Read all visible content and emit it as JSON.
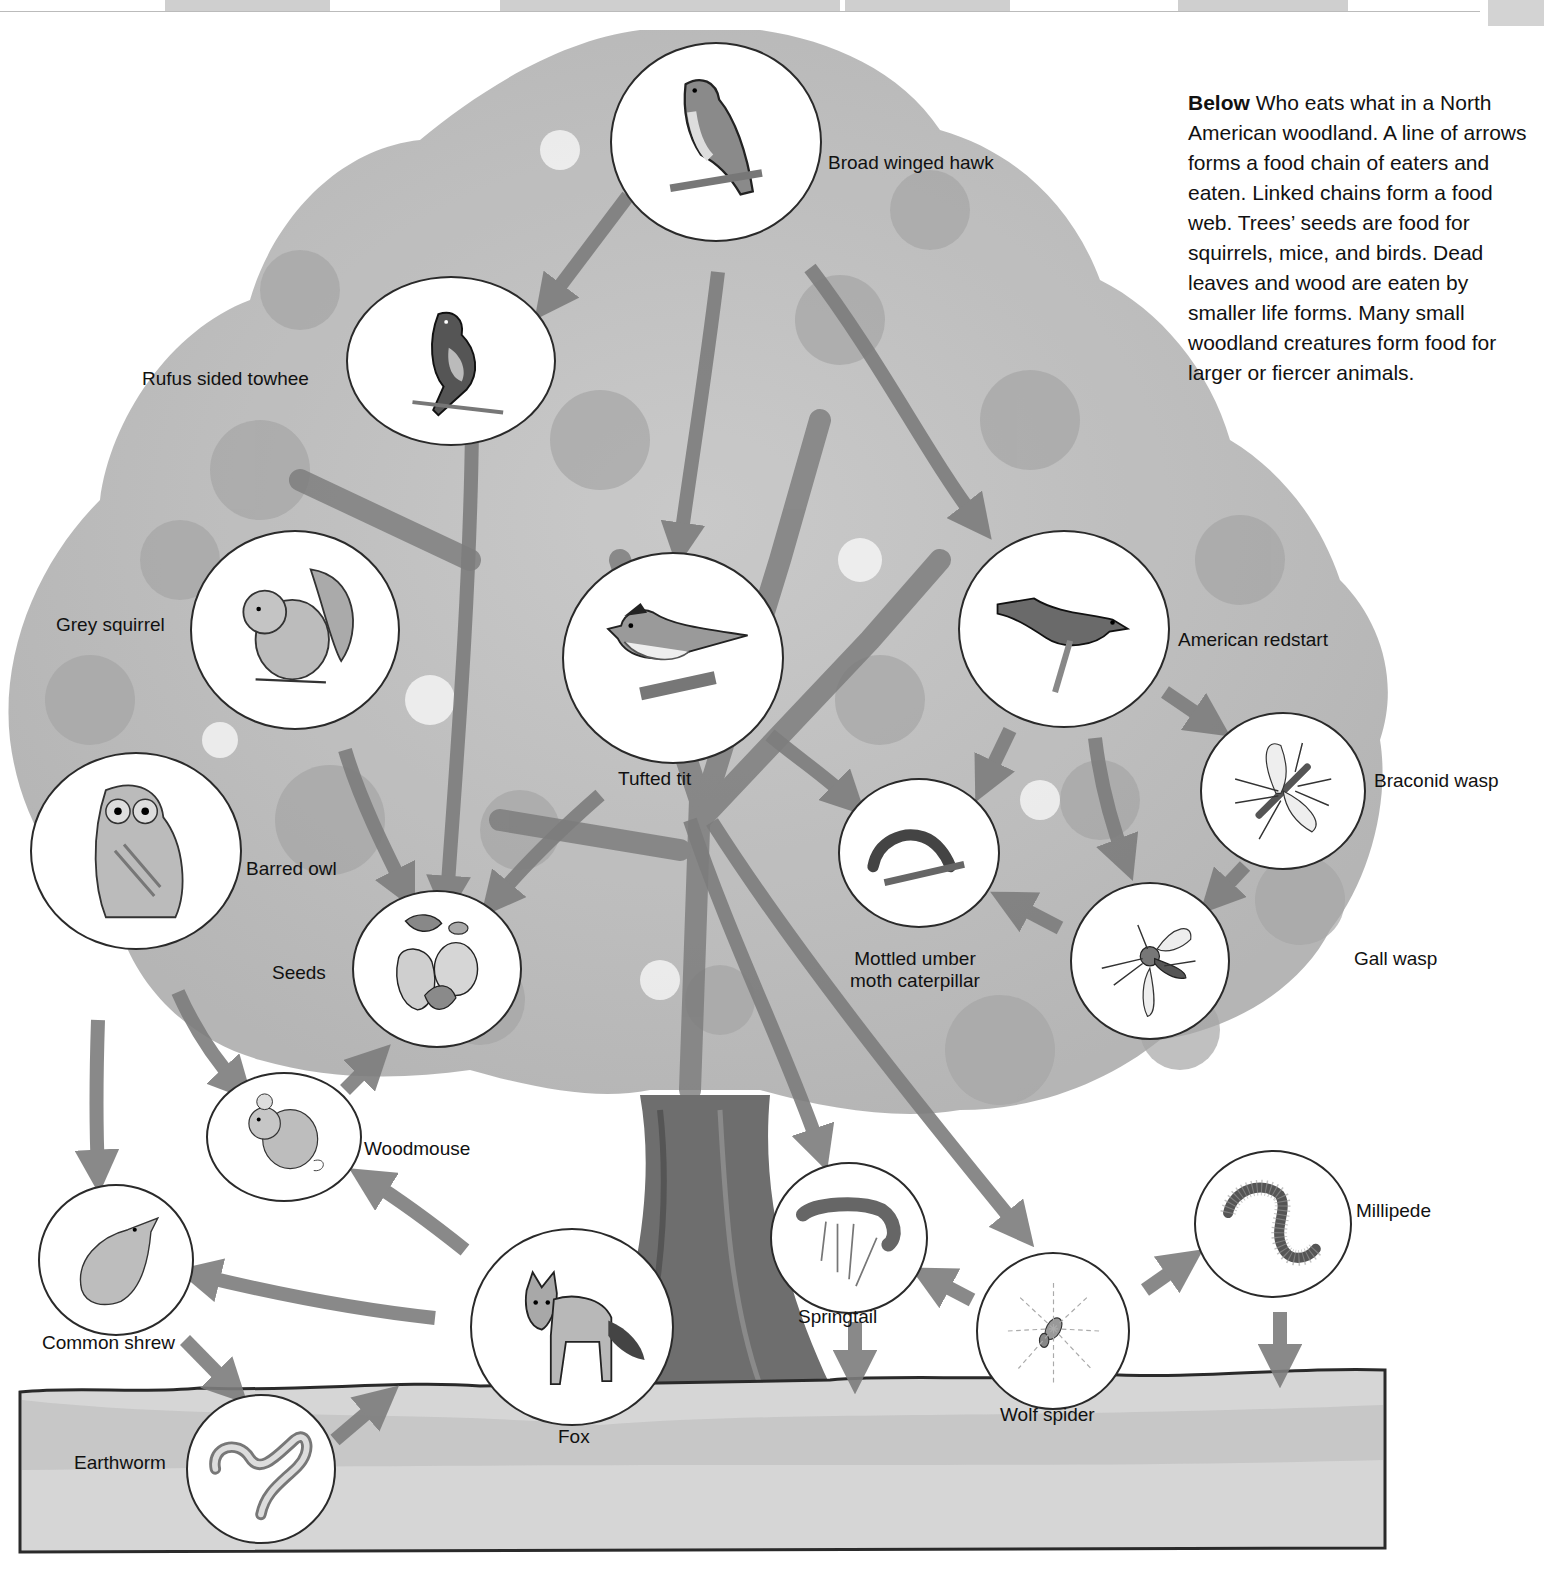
{
  "caption": {
    "lead": "Below",
    "text": "Who eats what in a North American woodland. A line of arrows forms a food chain of eaters and eaten. Linked chains form a food web. Trees’ seeds are food for squirrels, mice, and birds. Dead leaves and wood are eaten by smaller life forms. Many small woodland creatures form food for larger or fiercer animals."
  },
  "colors": {
    "canopy": "#b9b9b9",
    "canopy_dark": "#9a9a9a",
    "trunk": "#6e6e6e",
    "soil": "#d6d6d6",
    "arrow": "#7d7d7d",
    "outline": "#2a2a2a"
  },
  "organisms": [
    {
      "id": "hawk",
      "label": "Broad winged hawk",
      "icon": "hawk-icon"
    },
    {
      "id": "towhee",
      "label": "Rufus sided towhee",
      "icon": "towhee-icon"
    },
    {
      "id": "squirrel",
      "label": "Grey squirrel",
      "icon": "squirrel-icon"
    },
    {
      "id": "tit",
      "label": "Tufted tit",
      "icon": "tufted-tit-icon"
    },
    {
      "id": "redstart",
      "label": "American redstart",
      "icon": "redstart-icon"
    },
    {
      "id": "owl",
      "label": "Barred owl",
      "icon": "owl-icon"
    },
    {
      "id": "seeds",
      "label": "Seeds",
      "icon": "acorn-icon"
    },
    {
      "id": "caterpillar",
      "label": "Mottled umber moth caterpillar",
      "icon": "caterpillar-icon"
    },
    {
      "id": "braconid",
      "label": "Braconid wasp",
      "icon": "braconid-wasp-icon"
    },
    {
      "id": "gallwasp",
      "label": "Gall wasp",
      "icon": "gall-wasp-icon"
    },
    {
      "id": "woodmouse",
      "label": "Woodmouse",
      "icon": "mouse-icon"
    },
    {
      "id": "shrew",
      "label": "Common shrew",
      "icon": "shrew-icon"
    },
    {
      "id": "fox",
      "label": "Fox",
      "icon": "fox-icon"
    },
    {
      "id": "springtail",
      "label": "Springtail",
      "icon": "springtail-icon"
    },
    {
      "id": "wolfspider",
      "label": "Wolf spider",
      "icon": "spider-icon"
    },
    {
      "id": "millipede",
      "label": "Millipede",
      "icon": "millipede-icon"
    },
    {
      "id": "earthworm",
      "label": "Earthworm",
      "icon": "earthworm-icon"
    }
  ],
  "labels": {
    "caterpillar_line1": "Mottled umber",
    "caterpillar_line2": "moth caterpillar"
  },
  "arrows": [
    {
      "from": "hawk",
      "to": "towhee"
    },
    {
      "from": "hawk",
      "to": "tit"
    },
    {
      "from": "hawk",
      "to": "redstart"
    },
    {
      "from": "towhee",
      "to": "seeds"
    },
    {
      "from": "squirrel",
      "to": "seeds"
    },
    {
      "from": "tit",
      "to": "seeds"
    },
    {
      "from": "tit",
      "to": "caterpillar"
    },
    {
      "from": "tit",
      "to": "springtail"
    },
    {
      "from": "tit",
      "to": "wolfspider"
    },
    {
      "from": "redstart",
      "to": "braconid"
    },
    {
      "from": "redstart",
      "to": "caterpillar"
    },
    {
      "from": "redstart",
      "to": "gallwasp"
    },
    {
      "from": "braconid",
      "to": "gallwasp"
    },
    {
      "from": "gallwasp",
      "to": "caterpillar"
    },
    {
      "from": "owl",
      "to": "woodmouse"
    },
    {
      "from": "owl",
      "to": "shrew"
    },
    {
      "from": "woodmouse",
      "to": "seeds"
    },
    {
      "from": "fox",
      "to": "woodmouse"
    },
    {
      "from": "fox",
      "to": "shrew"
    },
    {
      "from": "shrew",
      "to": "earthworm"
    },
    {
      "from": "earthworm",
      "to": "soil"
    },
    {
      "from": "wolfspider",
      "to": "springtail"
    },
    {
      "from": "wolfspider",
      "to": "millipede"
    },
    {
      "from": "springtail",
      "to": "soil"
    },
    {
      "from": "millipede",
      "to": "soil"
    }
  ]
}
